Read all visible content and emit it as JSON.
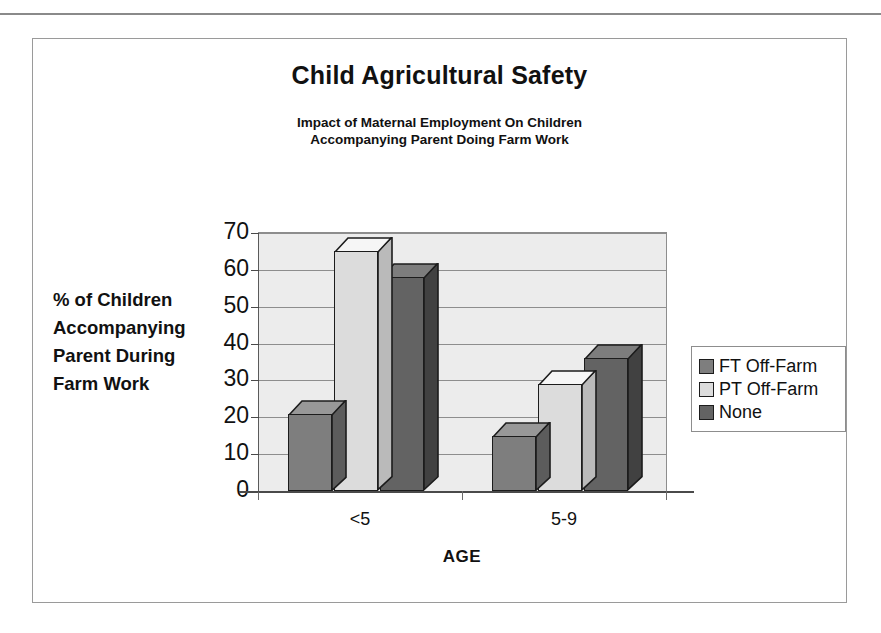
{
  "chart_data": {
    "type": "bar",
    "title": "Child Agricultural Safety",
    "subtitle_line1": "Impact of Maternal Employment On Children",
    "subtitle_line2": "Accompanying Parent Doing Farm Work",
    "xlabel": "AGE",
    "ylabel_line1": "% of Children",
    "ylabel_line2": "Accompanying",
    "ylabel_line3": "Parent During",
    "ylabel_line4": "Farm Work",
    "categories": [
      "<5",
      "5-9"
    ],
    "ylim": [
      0,
      70
    ],
    "yticks": [
      "70",
      "60",
      "50",
      "40",
      "30",
      "20",
      "10",
      "0"
    ],
    "ytick_values": [
      70,
      60,
      50,
      40,
      30,
      20,
      10,
      0
    ],
    "grid": true,
    "legend_position": "right",
    "series": [
      {
        "name": "FT Off-Farm",
        "color": "#7e7e7e",
        "values": [
          21,
          15
        ]
      },
      {
        "name": "PT Off-Farm",
        "color": "#dcdcdc",
        "values": [
          65,
          29
        ]
      },
      {
        "name": "None",
        "color": "#636363",
        "values": [
          58,
          36
        ]
      }
    ]
  },
  "legend": {
    "items": [
      {
        "label": "FT Off-Farm",
        "color": "#7e7e7e"
      },
      {
        "label": "PT Off-Farm",
        "color": "#dcdcdc"
      },
      {
        "label": "None",
        "color": "#636363"
      }
    ]
  },
  "colors": {
    "plot_background": "#ececec",
    "page_background": "#ffffff",
    "frame_border": "#9a9a9a",
    "gridline": "#8d8d8d",
    "axis": "#4a4a4a",
    "text": "#111111"
  }
}
